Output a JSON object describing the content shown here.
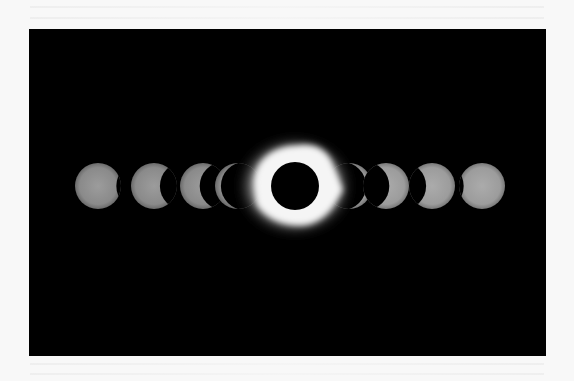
{
  "image": {
    "subject": "Solar eclipse time-lapse sequence",
    "background_color": "#f8f8f8",
    "photo_background": "#000000",
    "photo_frame": {
      "x": 29,
      "y": 29,
      "width": 517,
      "height": 327
    }
  },
  "sequence": {
    "center_y": 186,
    "sun_radius": 23,
    "phases": [
      {
        "id": "phase-1",
        "cx": 98,
        "coverage": 0.08,
        "side": "right",
        "color": "#8a8a8a"
      },
      {
        "id": "phase-2",
        "cx": 154,
        "coverage": 0.35,
        "side": "right",
        "color": "#8e8e8e"
      },
      {
        "id": "phase-3",
        "cx": 203,
        "coverage": 0.55,
        "side": "right",
        "color": "#8c8c8c"
      },
      {
        "id": "phase-4",
        "cx": 238,
        "coverage": 0.85,
        "side": "right",
        "color": "#9a9a9a"
      },
      {
        "id": "phase-6",
        "cx": 349,
        "coverage": 0.85,
        "side": "left",
        "color": "#9a9a9a"
      },
      {
        "id": "phase-7",
        "cx": 386,
        "coverage": 0.55,
        "side": "left",
        "color": "#959595"
      },
      {
        "id": "phase-8",
        "cx": 432,
        "coverage": 0.35,
        "side": "left",
        "color": "#a0a0a0"
      },
      {
        "id": "phase-9",
        "cx": 482,
        "coverage": 0.08,
        "side": "left",
        "color": "#a2a2a2"
      }
    ],
    "totality": {
      "cx": 295,
      "cy": 186,
      "moon_radius": 24,
      "corona_color": "#f5f5f5"
    }
  }
}
